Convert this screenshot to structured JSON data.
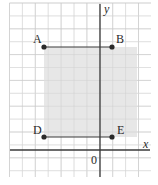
{
  "diagram": {
    "type": "coordinate-grid",
    "axes": {
      "x_label": "x",
      "y_label": "y",
      "origin_label": "0"
    },
    "points": [
      {
        "label": "A",
        "px": 44,
        "py": 47
      },
      {
        "label": "B",
        "px": 112,
        "py": 47
      },
      {
        "label": "D",
        "px": 44,
        "py": 137
      },
      {
        "label": "E",
        "px": 112,
        "py": 137
      }
    ],
    "segments": [
      {
        "from": "A",
        "to": "B"
      },
      {
        "from": "D",
        "to": "E"
      }
    ],
    "shaded_region": {
      "x": 44,
      "y": 47,
      "width": 93,
      "height": 90,
      "color": "#e3e3e3"
    },
    "colors": {
      "grid_minor": "#e2e2e2",
      "grid_major": "#cfcfcf",
      "axis": "#3a3a3a",
      "segment": "#3a3a3a",
      "point": "#2a2a2a"
    }
  }
}
